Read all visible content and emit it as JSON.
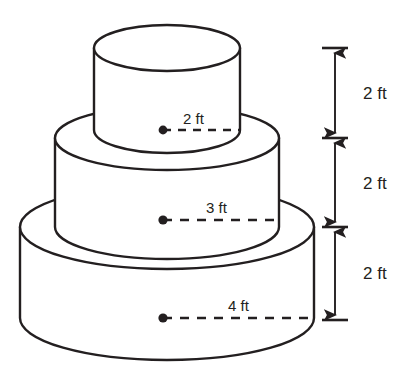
{
  "figure": {
    "stroke_color": "#231f20",
    "fill_color": "#ffffff",
    "background": "#ffffff"
  },
  "tiers": [
    {
      "id": "top",
      "name": "top-tier",
      "radius_label": "2 ft",
      "height_label": "2 ft",
      "center_x": 167,
      "top_ellipse_cy": 48,
      "bottom_ellipse_cy": 130,
      "rx": 73,
      "ry": 23
    },
    {
      "id": "middle",
      "name": "middle-tier",
      "radius_label": "3 ft",
      "height_label": "2 ft",
      "center_x": 167,
      "top_ellipse_cy": 138,
      "bottom_ellipse_cy": 227,
      "rx": 112,
      "ry": 32
    },
    {
      "id": "bottom",
      "name": "bottom-tier",
      "radius_label": "4 ft",
      "height_label": "2 ft",
      "center_x": 167,
      "top_ellipse_cy": 227,
      "bottom_ellipse_cy": 318,
      "rx": 147,
      "ry": 42
    }
  ],
  "radius_markers": [
    {
      "label": "2 ft",
      "dot_x": 163,
      "dot_y": 130,
      "end_x": 240,
      "text_x": 188,
      "text_y": 124
    },
    {
      "label": "3 ft",
      "dot_x": 163,
      "dot_y": 220,
      "end_x": 279,
      "text_x": 206,
      "text_y": 213
    },
    {
      "label": "4 ft",
      "dot_x": 163,
      "dot_y": 318,
      "end_x": 314,
      "text_x": 228,
      "text_y": 311
    }
  ],
  "height_dimensions": [
    {
      "label": "2 ft",
      "top_y": 48,
      "bottom_y": 138,
      "label_x": 365,
      "label_y": 99
    },
    {
      "label": "2 ft",
      "top_y": 138,
      "bottom_y": 227,
      "label_x": 365,
      "label_y": 189
    },
    {
      "label": "2 ft",
      "top_y": 227,
      "bottom_y": 320,
      "label_x": 365,
      "label_y": 279
    }
  ],
  "dimension_axis": {
    "line_x": 335,
    "tick_half_width": 13,
    "tick_ys": [
      48,
      138,
      227,
      320
    ]
  }
}
